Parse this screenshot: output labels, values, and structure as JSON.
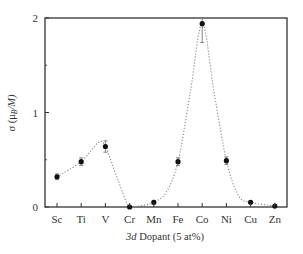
{
  "chart_data": {
    "type": "line",
    "title": "",
    "xlabel": "3d Dopant (5 at%)",
    "xlabel_italic_part": "3d",
    "xlabel_rest": " Dopant (5 at%)",
    "ylabel": "σ (μB/M)",
    "ylabel_parts": {
      "sigma": "σ (",
      "mu": "μ",
      "sub": "B",
      "rest": "/M)"
    },
    "categories": [
      "Sc",
      "Ti",
      "V",
      "Cr",
      "Mn",
      "Fe",
      "Co",
      "Ni",
      "Cu",
      "Zn"
    ],
    "values": [
      0.32,
      0.48,
      0.64,
      0.0,
      0.05,
      0.48,
      1.94,
      0.49,
      0.05,
      0.01
    ],
    "errors": [
      0.03,
      0.04,
      0.06,
      0.0,
      0.02,
      0.04,
      0.2,
      0.04,
      0.01,
      0.01
    ],
    "ylim": [
      0,
      2
    ],
    "yticks": [
      0,
      1,
      2
    ],
    "ytick_labels": [
      "0",
      "1",
      "2"
    ],
    "grid": false,
    "legend": null,
    "fit_curve": "dotted smooth guide-to-the-eye line through points"
  },
  "colors": {
    "axis": "#333333",
    "marker": "#111111",
    "curve": "#888888"
  }
}
